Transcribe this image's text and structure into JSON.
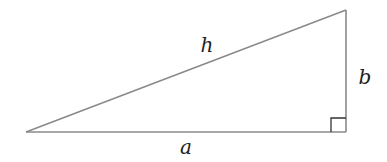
{
  "diagram": {
    "type": "right-triangle",
    "vertices": {
      "left": [
        26,
        132
      ],
      "right_angle": [
        346,
        132
      ],
      "top": [
        346,
        10
      ]
    },
    "right_angle_marker_size": 15,
    "colors": {
      "sides": "#8a8a8a",
      "marker": "#333333",
      "labels": "#222222"
    },
    "labels": {
      "hypotenuse": "h",
      "vertical_leg": "b",
      "horizontal_leg": "a"
    }
  }
}
